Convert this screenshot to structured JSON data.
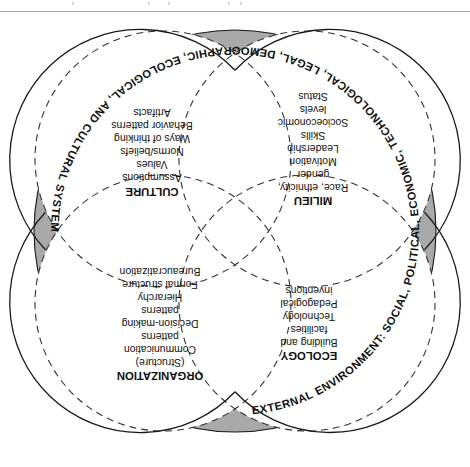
{
  "figure": {
    "orientation": "rotated-180",
    "ring_label": "EXTERNAL ENVIRONMENT: SOCIAL, POLITICAL, ECONOMIC, TECHNOLOGICAL, LEGAL, DEMOGRAPHIC, ECOLOGICAL, AND CULTURAL SYSTEMS",
    "ring_color": "#a9a9a9",
    "outline_color": "#1a1a1a",
    "fill_color": "#ffffff",
    "background_color": "#ffffff"
  },
  "circles": [
    {
      "id": "culture",
      "heading": "CULTURE",
      "items": [
        "Assumptions",
        "Values",
        "Norms/beliefs",
        "Ways of thinking",
        "Behavior patterns",
        "Artifacts"
      ]
    },
    {
      "id": "milieu",
      "heading": "MILIEU",
      "items": [
        "Race, ethnicity,",
        "gender",
        "Motivation",
        "Leadership",
        "Skills",
        "Socioeconomic",
        "levels",
        "Status"
      ]
    },
    {
      "id": "organization",
      "heading": "ORGANIZATION",
      "items": [
        "(Structure)",
        "Communication",
        "patterns",
        "Decision-making",
        "patterns",
        "Hierarchy",
        "Formal structure",
        "Bureaucratization"
      ]
    },
    {
      "id": "ecology",
      "heading": "ECOLOGY",
      "items": [
        "Building and",
        "facilities",
        "Technology",
        "Pedagogical",
        "inventions"
      ]
    }
  ]
}
